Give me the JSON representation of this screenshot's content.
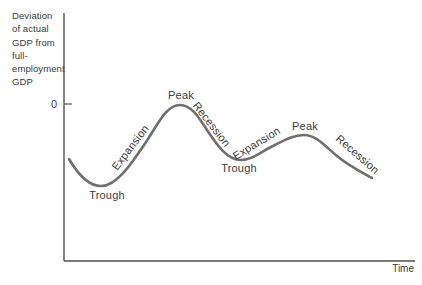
{
  "figure": {
    "background": "#ffffff",
    "text_color": "#3a3a3a",
    "axis_color": "#4f4f4f"
  },
  "axis": {
    "y_label": "Deviation\nof actual\nGDP from\nfull-\nemployment\nGDP",
    "zero_label": "0",
    "x_label": "Time"
  },
  "chart_data": {
    "type": "line",
    "xlabel": "Time",
    "ylabel": "Deviation of actual GDP from full-employment GDP",
    "grid": false,
    "legend": "none",
    "axes_px": {
      "origin": [
        64,
        261
      ],
      "y_axis_top": 13,
      "x_axis_right": 415,
      "zero_tick": [
        64,
        104,
        72,
        104
      ],
      "zero_label_pos": [
        57,
        108
      ],
      "time_label_pos": [
        414,
        272
      ]
    },
    "curve": {
      "color": "#6f6f6f",
      "stroke_width": 2.6,
      "start": [
        69,
        159
      ],
      "bezier_segments": [
        [
          76,
          171,
          87,
          186,
          101,
          186
        ],
        [
          117,
          186,
          132,
          163,
          148,
          139
        ],
        [
          159,
          122,
          167,
          105,
          180,
          105
        ],
        [
          191,
          105,
          198,
          116,
          207,
          130
        ],
        [
          217,
          145,
          227,
          160,
          241,
          160
        ],
        [
          253,
          160,
          262,
          151,
          273,
          146
        ],
        [
          283,
          141,
          293,
          135,
          304,
          135
        ],
        [
          316,
          135,
          325,
          146,
          337,
          156
        ],
        [
          349,
          166,
          361,
          172,
          372,
          178
        ]
      ]
    },
    "key_points_px": {
      "zero_line_y": 104,
      "start": [
        69,
        159
      ],
      "trough_1": [
        101,
        186
      ],
      "peak_1": [
        180,
        105
      ],
      "trough_2": [
        241,
        160
      ],
      "peak_2": [
        304,
        135
      ],
      "end": [
        372,
        178
      ]
    },
    "phases": [
      {
        "label": "Trough",
        "x": 107,
        "y": 196,
        "rotation": 0
      },
      {
        "label": "Expansion",
        "x": 131,
        "y": 148,
        "rotation": -53
      },
      {
        "label": "Peak",
        "x": 181,
        "y": 96,
        "rotation": 0
      },
      {
        "label": "Recession",
        "x": 211,
        "y": 125,
        "rotation": 52
      },
      {
        "label": "Trough",
        "x": 239,
        "y": 169,
        "rotation": 0
      },
      {
        "label": "Expansion",
        "x": 257,
        "y": 144,
        "rotation": -31
      },
      {
        "label": "Peak",
        "x": 305,
        "y": 127,
        "rotation": 0
      },
      {
        "label": "Recession",
        "x": 357,
        "y": 155,
        "rotation": 41
      }
    ]
  }
}
